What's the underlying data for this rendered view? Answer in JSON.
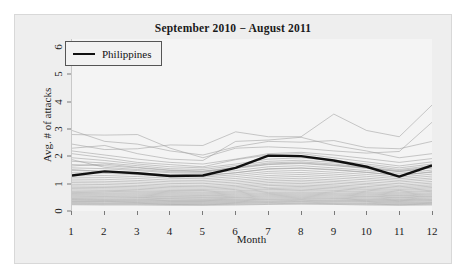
{
  "chart_data": {
    "type": "line",
    "title": "September 2010 − August 2011",
    "xlabel": "Month",
    "ylabel": "Avg. # of attacks",
    "x": [
      1,
      2,
      3,
      4,
      5,
      6,
      7,
      8,
      9,
      10,
      11,
      12
    ],
    "xtick_labels": [
      "1",
      "2",
      "3",
      "4",
      "5",
      "6",
      "7",
      "8",
      "9",
      "10",
      "11",
      "12"
    ],
    "ytick_labels": [
      "0",
      "1",
      "2",
      "3",
      "4",
      "5",
      "6"
    ],
    "yticks": [
      0,
      1,
      2,
      3,
      4,
      5,
      6
    ],
    "xlim": [
      1,
      12
    ],
    "ylim": [
      0,
      6.3
    ],
    "grid": false,
    "legend_position": "top-left",
    "legend": [
      {
        "name": "Philippines",
        "color": "#111111",
        "width": 2.4
      }
    ],
    "highlight_series": {
      "name": "Philippines",
      "color": "#111111",
      "values": [
        1.3,
        1.45,
        1.38,
        1.28,
        1.3,
        1.58,
        2.03,
        2.01,
        1.85,
        1.62,
        1.26,
        1.67
      ]
    },
    "background_series_color": "#9a9a9a",
    "background_series": [
      {
        "name": "country-01",
        "values": [
          2.95,
          2.55,
          2.45,
          2.2,
          2.05,
          2.35,
          2.55,
          2.52,
          2.58,
          2.32,
          2.28,
          2.55
        ]
      },
      {
        "name": "country-02",
        "values": [
          2.8,
          2.78,
          2.8,
          2.3,
          1.95,
          2.3,
          2.35,
          2.3,
          2.2,
          2.12,
          2.18,
          3.25
        ]
      },
      {
        "name": "country-03",
        "values": [
          2.45,
          2.25,
          2.28,
          2.42,
          2.4,
          2.9,
          2.72,
          2.72,
          3.55,
          2.95,
          2.72,
          3.88
        ]
      },
      {
        "name": "country-04",
        "values": [
          2.3,
          2.4,
          2.1,
          1.9,
          1.85,
          2.55,
          2.6,
          2.7,
          2.4,
          2.2,
          1.95,
          2.1
        ]
      },
      {
        "name": "country-05",
        "values": [
          2.1,
          1.95,
          1.78,
          1.7,
          1.62,
          1.88,
          2.05,
          2.1,
          1.95,
          1.8,
          1.65,
          1.8
        ]
      },
      {
        "name": "country-06",
        "values": [
          1.95,
          1.85,
          1.72,
          1.62,
          1.58,
          1.72,
          1.9,
          1.95,
          1.85,
          1.72,
          1.58,
          1.72
        ]
      },
      {
        "name": "country-07",
        "values": [
          1.82,
          1.76,
          1.66,
          1.55,
          1.52,
          1.66,
          1.82,
          1.86,
          1.78,
          1.66,
          1.52,
          1.66
        ]
      },
      {
        "name": "country-08",
        "values": [
          1.7,
          1.66,
          1.58,
          1.48,
          1.45,
          1.58,
          1.72,
          1.76,
          1.68,
          1.58,
          1.45,
          1.58
        ]
      },
      {
        "name": "country-09",
        "values": [
          1.58,
          1.55,
          1.48,
          1.4,
          1.38,
          1.48,
          1.62,
          1.66,
          1.58,
          1.48,
          1.38,
          1.5
        ]
      },
      {
        "name": "country-10",
        "values": [
          1.48,
          1.46,
          1.4,
          1.33,
          1.31,
          1.4,
          1.53,
          1.57,
          1.5,
          1.41,
          1.31,
          1.42
        ]
      },
      {
        "name": "country-11",
        "values": [
          1.4,
          1.38,
          1.33,
          1.26,
          1.24,
          1.33,
          1.45,
          1.49,
          1.42,
          1.34,
          1.24,
          1.35
        ]
      },
      {
        "name": "country-12",
        "values": [
          1.32,
          1.3,
          1.26,
          1.2,
          1.18,
          1.26,
          1.38,
          1.41,
          1.35,
          1.27,
          1.18,
          1.28
        ]
      },
      {
        "name": "country-13",
        "values": [
          1.24,
          1.23,
          1.19,
          1.13,
          1.12,
          1.19,
          1.3,
          1.34,
          1.28,
          1.2,
          1.12,
          1.21
        ]
      },
      {
        "name": "country-14",
        "values": [
          1.17,
          1.16,
          1.12,
          1.07,
          1.06,
          1.12,
          1.23,
          1.27,
          1.21,
          1.14,
          1.06,
          1.15
        ]
      },
      {
        "name": "country-15",
        "values": [
          1.1,
          1.09,
          1.06,
          1.01,
          1.0,
          1.06,
          1.16,
          1.2,
          1.14,
          1.07,
          1.0,
          1.08
        ]
      },
      {
        "name": "country-16",
        "values": [
          1.04,
          1.03,
          1.0,
          0.95,
          0.94,
          1.0,
          1.1,
          1.13,
          1.08,
          1.01,
          0.94,
          1.02
        ]
      },
      {
        "name": "country-17",
        "values": [
          0.98,
          0.97,
          0.94,
          0.9,
          0.89,
          0.94,
          1.04,
          1.07,
          1.02,
          0.96,
          0.89,
          0.96
        ]
      },
      {
        "name": "country-18",
        "values": [
          0.92,
          0.91,
          0.89,
          0.85,
          0.84,
          0.89,
          0.98,
          1.01,
          0.96,
          0.9,
          0.84,
          0.91
        ]
      },
      {
        "name": "country-19",
        "values": [
          0.87,
          0.86,
          0.84,
          0.8,
          0.79,
          0.84,
          0.93,
          0.95,
          0.91,
          0.85,
          0.79,
          0.86
        ]
      },
      {
        "name": "country-20",
        "values": [
          0.82,
          0.81,
          0.79,
          0.75,
          0.75,
          0.79,
          0.87,
          0.9,
          0.86,
          0.8,
          0.75,
          0.81
        ]
      },
      {
        "name": "country-21",
        "values": [
          0.77,
          0.76,
          0.74,
          0.71,
          0.7,
          0.74,
          0.82,
          0.85,
          0.81,
          0.76,
          0.7,
          0.76
        ]
      },
      {
        "name": "country-22",
        "values": [
          0.72,
          0.72,
          0.7,
          0.67,
          0.66,
          0.7,
          0.78,
          0.8,
          0.76,
          0.71,
          0.66,
          0.72
        ]
      },
      {
        "name": "country-23",
        "values": [
          0.68,
          0.67,
          0.66,
          0.63,
          0.62,
          0.66,
          0.73,
          0.75,
          0.72,
          0.67,
          0.62,
          0.67
        ]
      },
      {
        "name": "country-24",
        "values": [
          0.64,
          0.63,
          0.62,
          0.59,
          0.58,
          0.62,
          0.68,
          0.7,
          0.67,
          0.63,
          0.58,
          0.63
        ]
      },
      {
        "name": "country-25",
        "values": [
          0.6,
          0.59,
          0.58,
          0.55,
          0.55,
          0.58,
          0.64,
          0.66,
          0.63,
          0.59,
          0.55,
          0.59
        ]
      },
      {
        "name": "country-26",
        "values": [
          0.56,
          0.55,
          0.54,
          0.52,
          0.51,
          0.54,
          0.6,
          0.62,
          0.59,
          0.55,
          0.51,
          0.55
        ]
      },
      {
        "name": "country-27",
        "values": [
          0.52,
          0.52,
          0.5,
          0.48,
          0.48,
          0.5,
          0.56,
          0.58,
          0.55,
          0.52,
          0.48,
          0.52
        ]
      },
      {
        "name": "country-28",
        "values": [
          0.48,
          0.48,
          0.47,
          0.45,
          0.44,
          0.47,
          0.52,
          0.54,
          0.51,
          0.48,
          0.44,
          0.48
        ]
      },
      {
        "name": "country-29",
        "values": [
          0.45,
          0.44,
          0.43,
          0.41,
          0.41,
          0.43,
          0.48,
          0.5,
          0.47,
          0.44,
          0.41,
          0.44
        ]
      },
      {
        "name": "country-30",
        "values": [
          0.42,
          0.41,
          0.4,
          0.38,
          0.38,
          0.4,
          0.44,
          0.46,
          0.44,
          0.41,
          0.38,
          0.41
        ]
      },
      {
        "name": "country-31",
        "values": [
          0.38,
          0.38,
          0.37,
          0.35,
          0.35,
          0.37,
          0.41,
          0.42,
          0.4,
          0.38,
          0.35,
          0.38
        ]
      },
      {
        "name": "country-32",
        "values": [
          0.35,
          0.35,
          0.34,
          0.32,
          0.32,
          0.34,
          0.37,
          0.39,
          0.37,
          0.35,
          0.32,
          0.34
        ]
      },
      {
        "name": "country-33",
        "values": [
          0.32,
          0.32,
          0.31,
          0.29,
          0.29,
          0.31,
          0.34,
          0.35,
          0.34,
          0.32,
          0.29,
          0.31
        ]
      },
      {
        "name": "country-34",
        "values": [
          0.29,
          0.28,
          0.28,
          0.26,
          0.26,
          0.28,
          0.31,
          0.32,
          0.3,
          0.28,
          0.26,
          0.28
        ]
      },
      {
        "name": "country-35",
        "values": [
          0.26,
          0.25,
          0.25,
          0.24,
          0.23,
          0.25,
          0.27,
          0.28,
          0.27,
          0.25,
          0.23,
          0.25
        ]
      },
      {
        "name": "country-36",
        "values": [
          0.23,
          0.22,
          0.22,
          0.21,
          0.21,
          0.22,
          0.24,
          0.25,
          0.24,
          0.22,
          0.21,
          0.22
        ]
      },
      {
        "name": "country-37",
        "values": [
          1.52,
          1.44,
          1.36,
          1.3,
          1.28,
          1.4,
          1.55,
          1.58,
          1.52,
          1.42,
          1.3,
          1.44
        ]
      },
      {
        "name": "country-38",
        "values": [
          1.88,
          1.6,
          1.52,
          1.44,
          1.42,
          1.56,
          1.7,
          1.74,
          1.66,
          1.56,
          1.44,
          1.58
        ]
      },
      {
        "name": "country-39",
        "values": [
          2.2,
          2.05,
          1.9,
          1.78,
          1.72,
          1.9,
          2.1,
          2.15,
          2.05,
          1.92,
          1.78,
          1.92
        ]
      },
      {
        "name": "country-40",
        "values": [
          1.65,
          1.72,
          1.6,
          1.5,
          1.46,
          1.6,
          1.76,
          1.8,
          1.72,
          1.6,
          1.48,
          1.62
        ]
      }
    ]
  }
}
